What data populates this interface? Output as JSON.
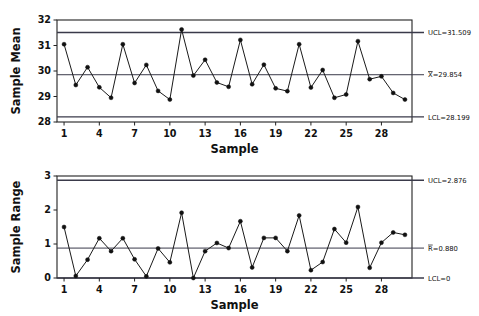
{
  "figure": {
    "type": "control-chart-pair",
    "background": "#ffffff",
    "line_color": "#1a1a1a",
    "marker_color": "#111111",
    "limit_color": "#3a3a4a"
  },
  "charts": [
    {
      "id": "xbar-chart",
      "name": "sample-mean-chart",
      "ylabel": "Sample Mean",
      "xlabel": "Sample",
      "ylim": [
        28,
        32
      ],
      "yticks": [
        28,
        29,
        30,
        31,
        32
      ],
      "ytick_labels": [
        "28",
        "29",
        "30",
        "31",
        "32"
      ],
      "xlim": [
        0.4,
        30.6
      ],
      "xticks": [
        1,
        4,
        7,
        10,
        13,
        16,
        19,
        22,
        25,
        28
      ],
      "xtick_labels": [
        "1",
        "4",
        "7",
        "10",
        "13",
        "16",
        "19",
        "22",
        "25",
        "28"
      ],
      "limits": [
        {
          "key": "ucl",
          "value": 31.509,
          "label_prefix": "UCL=",
          "label_value": "31.509",
          "label": "UCL=31.509",
          "overbar": false
        },
        {
          "key": "center",
          "value": 29.854,
          "label_prefix": "X=",
          "label_value": "29.854",
          "label": "X=29.854",
          "overbar": true,
          "overbar_char": "X"
        },
        {
          "key": "lcl",
          "value": 28.199,
          "label_prefix": "LCL=",
          "label_value": "28.199",
          "label": "LCL=28.199",
          "overbar": false
        }
      ],
      "series_name": "Sample Mean",
      "x": [
        1,
        2,
        3,
        4,
        5,
        6,
        7,
        8,
        9,
        10,
        11,
        12,
        13,
        14,
        15,
        16,
        17,
        18,
        19,
        20,
        21,
        22,
        23,
        24,
        25,
        26,
        27,
        28,
        29,
        30
      ],
      "values": [
        31.05,
        29.45,
        30.15,
        29.36,
        28.95,
        31.05,
        29.53,
        30.24,
        29.22,
        28.88,
        31.63,
        29.82,
        30.44,
        29.55,
        29.38,
        31.22,
        29.48,
        30.25,
        29.32,
        29.21,
        31.05,
        29.35,
        30.04,
        28.95,
        29.08,
        31.17,
        29.68,
        29.79,
        29.14,
        28.88
      ],
      "out_of_control_points": [
        11
      ]
    },
    {
      "id": "r-chart",
      "name": "sample-range-chart",
      "ylabel": "Sample Range",
      "xlabel": "Sample",
      "ylim": [
        0,
        3
      ],
      "yticks": [
        0,
        1,
        2,
        3
      ],
      "ytick_labels": [
        "0",
        "1",
        "2",
        "3"
      ],
      "xlim": [
        0.4,
        30.6
      ],
      "xticks": [
        1,
        4,
        7,
        10,
        13,
        16,
        19,
        22,
        25,
        28
      ],
      "xtick_labels": [
        "1",
        "4",
        "7",
        "10",
        "13",
        "16",
        "19",
        "22",
        "25",
        "28"
      ],
      "limits": [
        {
          "key": "ucl",
          "value": 2.876,
          "label_prefix": "UCL=",
          "label_value": "2.876",
          "label": "UCL=2.876",
          "overbar": false
        },
        {
          "key": "center",
          "value": 0.88,
          "label_prefix": "R=",
          "label_value": "0.880",
          "label": "R=0.880",
          "overbar": true,
          "overbar_char": "R"
        },
        {
          "key": "lcl",
          "value": 0,
          "label_prefix": "LCL=",
          "label_value": "0",
          "label": "LCL=0",
          "overbar": false
        }
      ],
      "series_name": "Sample Range",
      "x": [
        1,
        2,
        3,
        4,
        5,
        6,
        7,
        8,
        9,
        10,
        11,
        12,
        13,
        14,
        15,
        16,
        17,
        18,
        19,
        20,
        21,
        22,
        23,
        24,
        25,
        26,
        27,
        28,
        29,
        30
      ],
      "values": [
        1.5,
        0.06,
        0.54,
        1.17,
        0.79,
        1.17,
        0.55,
        0.05,
        0.87,
        0.46,
        1.92,
        0.0,
        0.79,
        1.03,
        0.88,
        1.67,
        0.31,
        1.18,
        1.18,
        0.79,
        1.84,
        0.23,
        0.47,
        1.44,
        1.04,
        2.09,
        0.3,
        1.04,
        1.34,
        1.27
      ],
      "out_of_control_points": []
    }
  ],
  "chart_data": {
    "type": "line",
    "title": "",
    "subtitle": "",
    "grid": false,
    "legend": "none",
    "xlabel": "Sample",
    "panels": [
      {
        "name": "Xbar chart",
        "ylabel": "Sample Mean",
        "ylim": [
          28,
          32
        ],
        "yticks": [
          28,
          29,
          30,
          31,
          32
        ],
        "x": [
          1,
          2,
          3,
          4,
          5,
          6,
          7,
          8,
          9,
          10,
          11,
          12,
          13,
          14,
          15,
          16,
          17,
          18,
          19,
          20,
          21,
          22,
          23,
          24,
          25,
          26,
          27,
          28,
          29,
          30
        ],
        "series": [
          {
            "name": "Sample Mean",
            "values": [
              31.05,
              29.45,
              30.15,
              29.36,
              28.95,
              31.05,
              29.53,
              30.24,
              29.22,
              28.88,
              31.63,
              29.82,
              30.44,
              29.55,
              29.38,
              31.22,
              29.48,
              30.25,
              29.32,
              29.21,
              31.05,
              29.35,
              30.04,
              28.95,
              29.08,
              31.17,
              29.68,
              29.79,
              29.14,
              28.88
            ]
          }
        ],
        "reference_lines": [
          {
            "name": "UCL",
            "value": 31.509,
            "label": "UCL=31.509"
          },
          {
            "name": "CenterLine",
            "value": 29.854,
            "label": "X=29.854"
          },
          {
            "name": "LCL",
            "value": 28.199,
            "label": "LCL=28.199"
          }
        ]
      },
      {
        "name": "R chart",
        "ylabel": "Sample Range",
        "ylim": [
          0,
          3
        ],
        "yticks": [
          0,
          1,
          2,
          3
        ],
        "x": [
          1,
          2,
          3,
          4,
          5,
          6,
          7,
          8,
          9,
          10,
          11,
          12,
          13,
          14,
          15,
          16,
          17,
          18,
          19,
          20,
          21,
          22,
          23,
          24,
          25,
          26,
          27,
          28,
          29,
          30
        ],
        "series": [
          {
            "name": "Sample Range",
            "values": [
              1.5,
              0.06,
              0.54,
              1.17,
              0.79,
              1.17,
              0.55,
              0.05,
              0.87,
              0.46,
              1.92,
              0.0,
              0.79,
              1.03,
              0.88,
              1.67,
              0.31,
              1.18,
              1.18,
              0.79,
              1.84,
              0.23,
              0.47,
              1.44,
              1.04,
              2.09,
              0.3,
              1.04,
              1.34,
              1.27
            ]
          }
        ],
        "reference_lines": [
          {
            "name": "UCL",
            "value": 2.876,
            "label": "UCL=2.876"
          },
          {
            "name": "CenterLine",
            "value": 0.88,
            "label": "R=0.880"
          },
          {
            "name": "LCL",
            "value": 0,
            "label": "LCL=0"
          }
        ]
      }
    ]
  }
}
